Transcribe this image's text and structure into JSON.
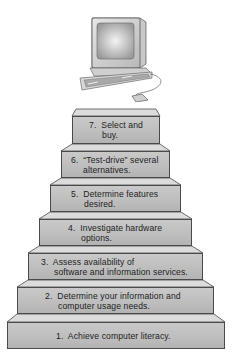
{
  "figure": {
    "type": "staircase",
    "illustration": "personal-computer-with-mouse",
    "colors": {
      "step_face": "#bdbdbd",
      "step_top": "#dcdcdc",
      "outline": "#4a4a4a",
      "text": "#1e1e1e"
    }
  },
  "steps": [
    {
      "number": "1.",
      "line1": "1.  Achieve computer literacy.",
      "line2": ""
    },
    {
      "number": "2.",
      "line1": "2.  Determine your information and",
      "line2": "computer usage needs."
    },
    {
      "number": "3.",
      "line1": "3.  Assess availability of",
      "line2": "software and information services."
    },
    {
      "number": "4.",
      "line1": "4.  Investigate hardware",
      "line2": "options."
    },
    {
      "number": "5.",
      "line1": "5.  Determine features",
      "line2": "desired."
    },
    {
      "number": "6.",
      "line1": "6.  “Test-drive” several",
      "line2": "alternatives."
    },
    {
      "number": "7.",
      "line1": "7.  Select and",
      "line2": "buy."
    }
  ]
}
